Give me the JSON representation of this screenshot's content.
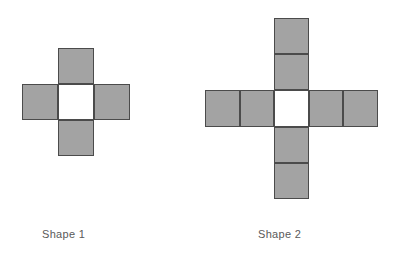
{
  "page": {
    "background_color": "#ffffff",
    "width": 399,
    "height": 263
  },
  "style": {
    "fill_gray": "#a3a3a3",
    "fill_white": "#ffffff",
    "stroke_color": "#4b4b4b",
    "caption_color": "#5a5a5a"
  },
  "figures": [
    {
      "id": "shape-1",
      "caption": "Shape 1",
      "grid_columns": 3,
      "grid_rows": 3,
      "gray_square_count": 4,
      "white_square_count": 1,
      "cells": [
        [
          "empty",
          "gray",
          "empty"
        ],
        [
          "gray",
          "white",
          "gray"
        ],
        [
          "empty",
          "gray",
          "empty"
        ]
      ]
    },
    {
      "id": "shape-2",
      "caption": "Shape 2",
      "grid_columns": 5,
      "grid_rows": 5,
      "gray_square_count": 8,
      "white_square_count": 1,
      "cells": [
        [
          "empty",
          "empty",
          "gray",
          "empty",
          "empty"
        ],
        [
          "empty",
          "empty",
          "gray",
          "empty",
          "empty"
        ],
        [
          "gray",
          "gray",
          "white",
          "gray",
          "gray"
        ],
        [
          "empty",
          "empty",
          "gray",
          "empty",
          "empty"
        ],
        [
          "empty",
          "empty",
          "gray",
          "empty",
          "empty"
        ]
      ]
    }
  ]
}
